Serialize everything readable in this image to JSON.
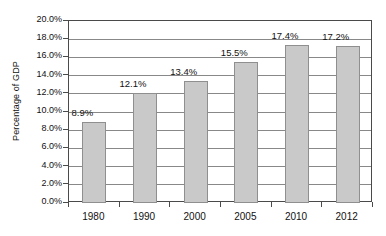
{
  "chart_data": {
    "type": "bar",
    "title": "",
    "subtitle": "",
    "xlabel": "",
    "ylabel": "Percentage of GDP",
    "categories": [
      "1980",
      "1990",
      "2000",
      "2005",
      "2010",
      "2012"
    ],
    "values": [
      8.9,
      12.1,
      13.4,
      15.5,
      17.4,
      17.2
    ],
    "data_labels": [
      "8.9%",
      "12.1%",
      "13.4%",
      "15.5%",
      "17.4%",
      "17.2%"
    ],
    "ylim": [
      0,
      20
    ],
    "ytick_values": [
      0,
      2,
      4,
      6,
      8,
      10,
      12,
      14,
      16,
      18,
      20
    ],
    "ytick_labels": [
      "0.0%",
      "2.0%",
      "4.0%",
      "6.0%",
      "8.0%",
      "10.0%",
      "12.0%",
      "14.0%",
      "16.0%",
      "18.0%",
      "20.0%"
    ],
    "grid": true,
    "grid_axis": "y",
    "legend": false,
    "legend_position": "none",
    "series": [
      {
        "name": "Percentage of GDP",
        "values": [
          8.9,
          12.1,
          13.4,
          15.5,
          17.4,
          17.2
        ]
      }
    ],
    "colors": {
      "bar_fill": "#c9c9c9",
      "bar_border": "#8f8f8f",
      "gridline": "#888888",
      "axis": "#4a4a4a",
      "text": "#111111",
      "background": "#ffffff"
    }
  }
}
